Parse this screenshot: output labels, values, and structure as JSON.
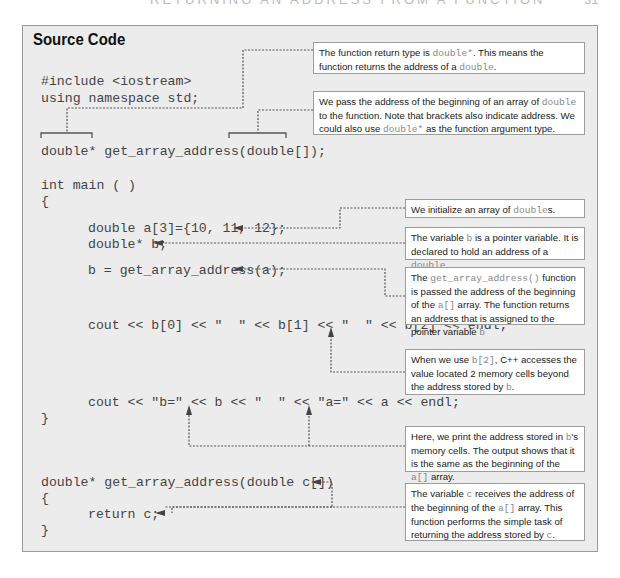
{
  "page": {
    "header": "RETURNING AN ADDRESS FROM A FUNCTION",
    "page_number": "31"
  },
  "panel": {
    "title": "Source Code",
    "code_lines": {
      "include": "#include <iostream>",
      "using": "using namespace std;",
      "prototype": "double* get_array_address(double[]);",
      "main_sig": "int main ( )",
      "open_brace": "{",
      "decl_a": "double a[3]={10, 11, 12};",
      "decl_b": "double* b;",
      "assign_b": "b = get_array_address(a);",
      "cout_values": "cout << b[0] << \"  \" << b[1] << \"  \" << b[2] << endl;",
      "cout_addresses": "cout << \"b=\" << b << \"  \" << \"a=\" << a << endl;",
      "close_brace": "}",
      "func_sig": "double* get_array_address(double c[])",
      "func_open": "{",
      "func_return": "return c;",
      "func_close": "}"
    },
    "notes": [
      {
        "id": "return-type",
        "parts": [
          {
            "t": "The function return type is "
          },
          {
            "t": "double*",
            "mono": true
          },
          {
            "t": ". This means the function returns the address of a "
          },
          {
            "t": "double",
            "mono": true
          },
          {
            "t": "."
          }
        ]
      },
      {
        "id": "pass-address",
        "parts": [
          {
            "t": "We pass the address of the beginning of an array of "
          },
          {
            "t": "double",
            "mono": true
          },
          {
            "t": " to the function. Note that brackets also indicate address. We could also use "
          },
          {
            "t": "double*",
            "mono": true
          },
          {
            "t": " as the function argument type."
          }
        ]
      },
      {
        "id": "init-array",
        "parts": [
          {
            "t": "We initialize an array of "
          },
          {
            "t": "double",
            "mono": true
          },
          {
            "t": "s."
          }
        ]
      },
      {
        "id": "pointer-var",
        "parts": [
          {
            "t": "The variable "
          },
          {
            "t": "b",
            "mono": true
          },
          {
            "t": " is a pointer variable. It is declared to hold an address of a "
          },
          {
            "t": "double",
            "mono": true
          },
          {
            "t": "."
          }
        ]
      },
      {
        "id": "func-call",
        "parts": [
          {
            "t": "The "
          },
          {
            "t": "get_array_address()",
            "mono": true
          },
          {
            "t": " function is passed the address of the beginning of the "
          },
          {
            "t": "a[]",
            "mono": true
          },
          {
            "t": " array. The function returns an address that is assigned to the pointer variable "
          },
          {
            "t": "b",
            "mono": true
          }
        ]
      },
      {
        "id": "index-access",
        "parts": [
          {
            "t": "When we use "
          },
          {
            "t": "b[2]",
            "mono": true
          },
          {
            "t": ", C++ accesses the value located 2 memory cells beyond the address stored by "
          },
          {
            "t": "b",
            "mono": true
          },
          {
            "t": "."
          }
        ]
      },
      {
        "id": "print-address",
        "parts": [
          {
            "t": "Here, we print the address stored in "
          },
          {
            "t": "b",
            "mono": true
          },
          {
            "t": "'s memory cells. The output shows that it is the same as the beginning of the "
          },
          {
            "t": "a[]",
            "mono": true
          },
          {
            "t": " array."
          }
        ]
      },
      {
        "id": "receive-address",
        "parts": [
          {
            "t": "The variable "
          },
          {
            "t": "c",
            "mono": true
          },
          {
            "t": " receives the address of the beginning of the "
          },
          {
            "t": "a[]",
            "mono": true
          },
          {
            "t": " array. This function performs the simple task of returning the address stored by "
          },
          {
            "t": "c",
            "mono": true
          },
          {
            "t": "."
          }
        ]
      }
    ]
  }
}
